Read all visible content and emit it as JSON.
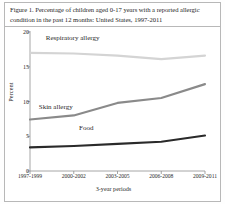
{
  "figure": {
    "caption": "Figure 1. Percentage of children aged 0-17 years with a reported allergic condition in the past 12 months: United States, 1997-2011"
  },
  "chart_data": {
    "type": "line",
    "title": "",
    "xlabel": "3-year periods",
    "ylabel": "Percent",
    "categories": [
      "1997-1999",
      "2000-2002",
      "2003-2005",
      "2006-2008",
      "2009-2011"
    ],
    "ylim": [
      0,
      20
    ],
    "yticks": [
      "0",
      "5",
      "10",
      "15",
      "20"
    ],
    "grid": false,
    "legend_position": "inline-annotations",
    "series": [
      {
        "name": "Respiratory allergy",
        "color": "#d4d4d4",
        "values": [
          17.0,
          16.9,
          16.6,
          16.1,
          16.6
        ]
      },
      {
        "name": "Skin allergy",
        "color": "#8a8a8a",
        "values": [
          7.4,
          8.0,
          9.8,
          10.5,
          12.5
        ]
      },
      {
        "name": "Food",
        "color": "#2a2a2a",
        "values": [
          3.4,
          3.6,
          3.9,
          4.2,
          5.1
        ]
      }
    ],
    "annotations": [
      {
        "text": "Respiratory allergy",
        "x_frac": 0.09,
        "y_value": 19.0
      },
      {
        "text": "Skin allergy",
        "x_frac": 0.05,
        "y_value": 9.1
      },
      {
        "text": "Food",
        "x_frac": 0.28,
        "y_value": 6.0
      }
    ]
  },
  "axis_colors": {
    "axis_line": "#8f8f8f",
    "frame": "#b8b8b8"
  }
}
